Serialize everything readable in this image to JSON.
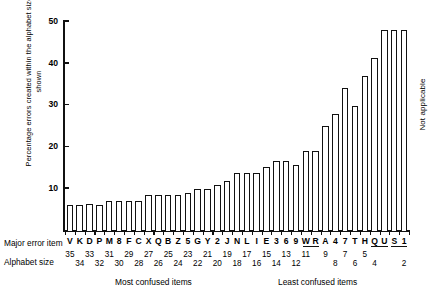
{
  "axes": {
    "ylabel": "Percentage errors created within the alphabet size shown",
    "yticks": [
      10,
      20,
      30,
      40,
      50
    ],
    "ylim": [
      0,
      50
    ],
    "row_caption_major": "Major error item",
    "row_caption_alphabet": "Alphabet size"
  },
  "annotations": {
    "not_applicable": "Not applicable",
    "most_confused": "Most confused items",
    "least_confused": "Least confused items"
  },
  "chart_data": {
    "type": "bar",
    "title": "",
    "xlabel": "Major error item / Alphabet size",
    "ylabel": "Percentage errors created within the alphabet size shown",
    "ylim": [
      0,
      50
    ],
    "yticks": [
      10,
      20,
      30,
      40,
      50
    ],
    "grid": false,
    "legend": "none",
    "categories": [
      "V",
      "K",
      "D",
      "P",
      "M",
      "8",
      "F",
      "C",
      "X",
      "Q",
      "B",
      "Z",
      "5",
      "G",
      "Y",
      "2",
      "J",
      "N",
      "L",
      "I",
      "E",
      "3",
      "6",
      "9",
      "W",
      "R",
      "A",
      "4",
      "7",
      "T",
      "H",
      "Q",
      "U",
      "S",
      "1"
    ],
    "alphabet_sizes": [
      35,
      34,
      33,
      32,
      31,
      30,
      29,
      28,
      27,
      26,
      25,
      24,
      23,
      22,
      21,
      20,
      19,
      18,
      17,
      16,
      15,
      14,
      13,
      12,
      11,
      null,
      9,
      8,
      7,
      6,
      5,
      4,
      null,
      null,
      2
    ],
    "alphabet_size_grouped_labels": [
      "35",
      "34",
      "33",
      "32",
      "31",
      "30",
      "29",
      "28",
      "27",
      "26",
      "25",
      "24",
      "23",
      "22",
      "21",
      "20",
      "19",
      "18",
      "17",
      "16",
      "15",
      "14",
      "13",
      "12",
      "11",
      "9",
      "8",
      "7",
      "6",
      "5",
      "4",
      "2"
    ],
    "values": [
      6.5,
      6.5,
      6.8,
      6.5,
      7.5,
      7.5,
      7.5,
      7.5,
      9.0,
      9.0,
      9.0,
      9.0,
      9.5,
      10.5,
      10.5,
      11.5,
      12.5,
      14.5,
      14.5,
      14.5,
      16.0,
      17.5,
      17.5,
      16.5,
      20.0,
      20.0,
      26.0,
      29.0,
      35.5,
      31.0,
      38.5,
      43.0,
      50.0,
      50.0,
      50.0
    ],
    "values_note": "Bar heights read against the 0-50 percentage axis; the four right-most bars are clipped at the 50 top of the scale.",
    "group_underlines": [
      {
        "label": "WR",
        "members": [
          "W",
          "R"
        ],
        "alphabet_size": "11"
      },
      {
        "label": "QU",
        "members": [
          "Q",
          "U"
        ],
        "alphabet_size": "4"
      },
      {
        "label": "S 1",
        "members": [
          "S",
          "1"
        ],
        "alphabet_size": "2"
      }
    ],
    "x_sections": [
      {
        "label": "Most confused items",
        "side": "left"
      },
      {
        "label": "Least confused items",
        "side": "right"
      }
    ],
    "right_note": "Not applicable"
  }
}
